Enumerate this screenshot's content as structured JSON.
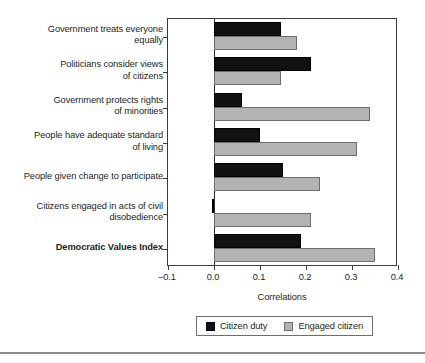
{
  "chart_data": {
    "type": "bar",
    "orientation": "horizontal",
    "title": "",
    "subtitle": "",
    "xlabel": "Correlations",
    "ylabel": "",
    "xlim": [
      -0.1,
      0.4
    ],
    "xticks": [
      "-0.1",
      "0.0",
      "0.1",
      "0.2",
      "0.3",
      "0.4"
    ],
    "xtick_values": [
      -0.1,
      0.0,
      0.1,
      0.2,
      0.3,
      0.4
    ],
    "grid": false,
    "legend_position": "bottom",
    "categories": [
      "Government treats everyone equally",
      "Politicians consider views of citizens",
      "Government protects rights of minorities",
      "People have adequate standard of living",
      "People given change to participate",
      "Citizens engaged in acts of civil disobedience",
      "Democratic Values Index"
    ],
    "category_lines": [
      [
        "Government treats everyone",
        "equally"
      ],
      [
        "Politicians consider views",
        "of citizens"
      ],
      [
        "Government protects rights",
        "of minorities"
      ],
      [
        "People have adequate standard",
        "of living"
      ],
      [
        "People given change to participate"
      ],
      [
        "Citizens engaged in acts of civil",
        "disobedience"
      ],
      [
        "Democratic Values Index"
      ]
    ],
    "category_bold": [
      false,
      false,
      false,
      false,
      false,
      false,
      true
    ],
    "series": [
      {
        "name": "Citizen duty",
        "color": "#111111",
        "values": [
          0.145,
          0.21,
          0.06,
          0.1,
          0.15,
          -0.005,
          0.19
        ]
      },
      {
        "name": "Engaged citizen",
        "color": "#b3b3b3",
        "values": [
          0.18,
          0.145,
          0.34,
          0.31,
          0.23,
          0.21,
          0.35
        ]
      }
    ]
  },
  "legend": {
    "entries": [
      {
        "label": "Citizen duty",
        "swatch": "black-square-swatch"
      },
      {
        "label": "Engaged citizen",
        "swatch": "gray-square-swatch"
      }
    ]
  },
  "axis": {
    "x_title": "Correlations"
  }
}
